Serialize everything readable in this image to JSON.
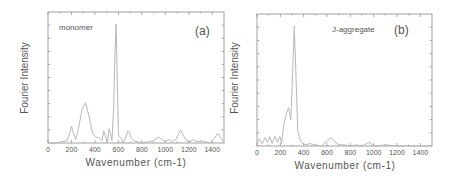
{
  "chart_data": [
    {
      "type": "line",
      "panel_label": "(a)",
      "annotation": "monomer",
      "title": "",
      "xlabel": "Wavenumber (cm-1)",
      "ylabel": "Fourier Intensity",
      "xlim": [
        0,
        1500
      ],
      "ylim": [
        0,
        1
      ],
      "xticks": [
        0,
        200,
        400,
        600,
        800,
        1000,
        1200,
        1400
      ],
      "xtick_labels": [
        "0",
        "200",
        "400",
        "600",
        "800",
        "1000",
        "1200",
        "1400"
      ],
      "yticks_labeled": false,
      "grid": false,
      "line_color": "#b8b8b8",
      "x": [
        0,
        60,
        120,
        160,
        185,
        200,
        215,
        235,
        260,
        290,
        320,
        350,
        380,
        410,
        440,
        460,
        475,
        490,
        505,
        520,
        530,
        545,
        560,
        570,
        580,
        590,
        600,
        610,
        625,
        640,
        660,
        680,
        695,
        710,
        730,
        760,
        800,
        850,
        900,
        940,
        970,
        1000,
        1030,
        1060,
        1090,
        1110,
        1130,
        1150,
        1180,
        1210,
        1240,
        1270,
        1300,
        1340,
        1380,
        1420,
        1445,
        1470,
        1500
      ],
      "y": [
        0.0,
        0.0,
        0.01,
        0.02,
        0.08,
        0.14,
        0.09,
        0.03,
        0.12,
        0.28,
        0.34,
        0.22,
        0.08,
        0.05,
        0.04,
        0.02,
        0.1,
        0.06,
        0.0,
        0.12,
        0.09,
        0.02,
        0.3,
        0.75,
        1.0,
        0.55,
        0.08,
        0.05,
        0.04,
        0.0,
        0.04,
        0.1,
        0.09,
        0.04,
        0.02,
        0.01,
        0.0,
        0.01,
        0.02,
        0.05,
        0.03,
        0.01,
        0.03,
        0.01,
        0.03,
        0.07,
        0.11,
        0.07,
        0.02,
        0.01,
        0.03,
        0.01,
        0.02,
        0.01,
        0.0,
        0.04,
        0.08,
        0.05,
        0.0
      ]
    },
    {
      "type": "line",
      "panel_label": "(b)",
      "annotation": "J-aggregate",
      "title": "",
      "xlabel": "Wavenumber (cm-1)",
      "ylabel": "Fourier Intensity",
      "xlim": [
        0,
        1500
      ],
      "ylim": [
        0,
        1
      ],
      "xticks": [
        0,
        200,
        400,
        600,
        800,
        1000,
        1200,
        1400
      ],
      "xtick_labels": [
        "0",
        "200",
        "400",
        "600",
        "800",
        "1000",
        "1200",
        "1400"
      ],
      "yticks_labeled": false,
      "grid": false,
      "line_color": "#b8b8b8",
      "x": [
        0,
        20,
        45,
        70,
        90,
        110,
        130,
        155,
        175,
        195,
        210,
        230,
        255,
        270,
        290,
        305,
        320,
        335,
        350,
        370,
        390,
        420,
        450,
        500,
        550,
        600,
        630,
        660,
        700,
        750,
        800,
        850,
        900,
        940,
        960,
        990,
        1030,
        1100,
        1200,
        1300,
        1400,
        1500
      ],
      "y": [
        0.02,
        0.06,
        0.02,
        0.07,
        0.03,
        0.08,
        0.02,
        0.08,
        0.03,
        0.08,
        0.02,
        0.18,
        0.28,
        0.32,
        0.22,
        0.6,
        1.0,
        0.55,
        0.12,
        0.05,
        0.02,
        0.01,
        0.02,
        0.01,
        0.0,
        0.04,
        0.07,
        0.04,
        0.01,
        0.01,
        0.0,
        0.01,
        0.0,
        0.02,
        0.03,
        0.01,
        0.0,
        0.01,
        0.0,
        0.0,
        0.0,
        0.0
      ]
    }
  ],
  "panels": [
    {
      "annotation": "monomer",
      "panel_label": "(a)",
      "ylabel": "Fourier Intensity",
      "xlabel": "Wavenumber (cm-1)"
    },
    {
      "annotation": "J-aggregate",
      "panel_label": "(b)",
      "ylabel": "Fourier Intensity",
      "xlabel": "Wavenumber (cm-1)"
    }
  ]
}
